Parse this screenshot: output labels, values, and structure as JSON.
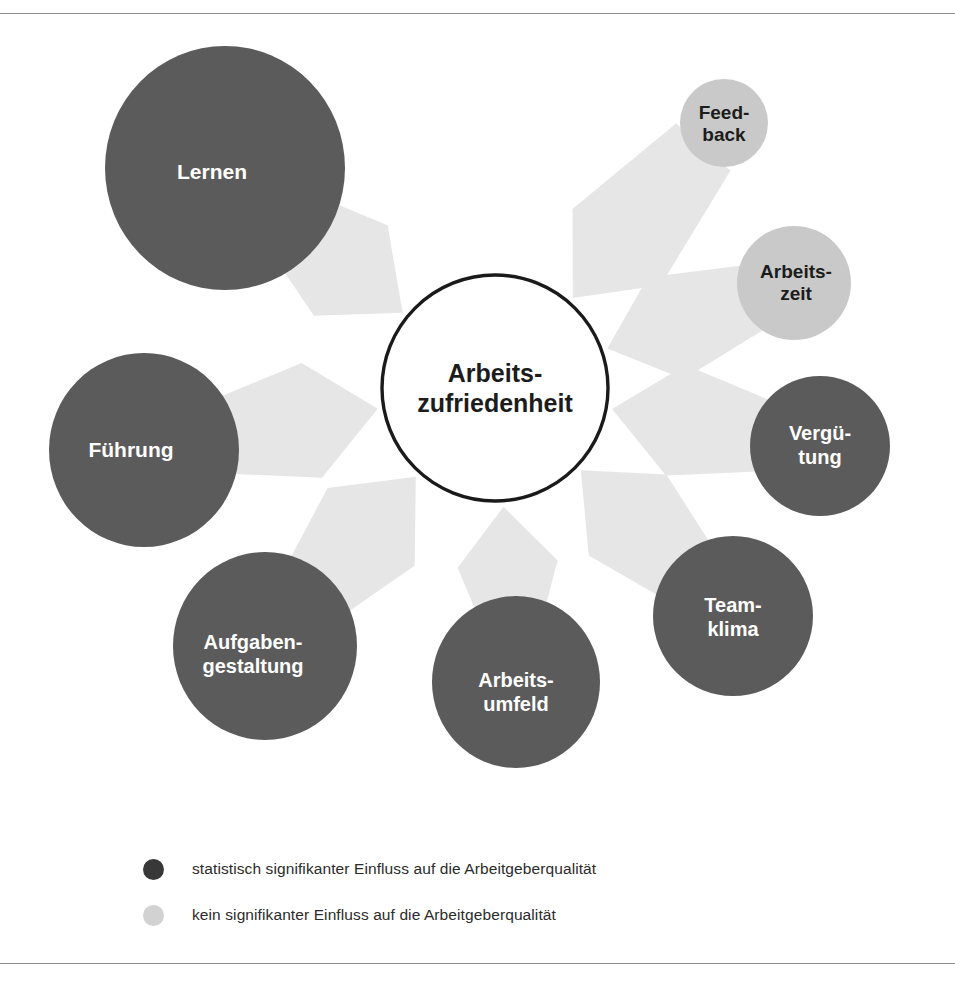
{
  "diagram": {
    "type": "hub-and-spoke",
    "center": {
      "id": "arbeitszufriedenheit",
      "label_line1": "Arbeits-",
      "label_line2": "zufriedenheit",
      "style": "outlined-white",
      "cx": 495,
      "cy": 388,
      "rx": 113,
      "ry": 113
    },
    "colors": {
      "significant_fill": "#5b5b5b",
      "significant_text": "#ffffff",
      "not_significant_fill": "#c9c9c9",
      "not_significant_text": "#1c1c1c",
      "arrow_fill": "#e6e6e6",
      "center_stroke": "#1a1a1a",
      "center_fill": "#ffffff",
      "background": "#ffffff",
      "rule": "#8e8e8e"
    },
    "nodes": [
      {
        "id": "lernen",
        "label_line1": "Lernen",
        "label_line2": "",
        "significant": true,
        "cx": 225,
        "cy": 168,
        "rx": 120,
        "ry": 122,
        "label_cx": 212,
        "label_cy": 172,
        "font_size": 21
      },
      {
        "id": "feedback",
        "label_line1": "Feed-",
        "label_line2": "back",
        "significant": false,
        "cx": 724,
        "cy": 123,
        "rx": 44,
        "ry": 44,
        "label_cx": 724,
        "label_cy": 124,
        "font_size": 19
      },
      {
        "id": "arbeitszeit",
        "label_line1": "Arbeits-",
        "label_line2": "zeit",
        "significant": false,
        "cx": 794,
        "cy": 283,
        "rx": 57,
        "ry": 57,
        "label_cx": 796,
        "label_cy": 283,
        "font_size": 19
      },
      {
        "id": "verguetung",
        "label_line1": "Vergü-",
        "label_line2": "tung",
        "significant": true,
        "cx": 820,
        "cy": 446,
        "rx": 70,
        "ry": 70,
        "label_cx": 820,
        "label_cy": 446,
        "font_size": 20
      },
      {
        "id": "teamklima",
        "label_line1": "Team-",
        "label_line2": "klima",
        "significant": true,
        "cx": 733,
        "cy": 616,
        "rx": 80,
        "ry": 80,
        "label_cx": 733,
        "label_cy": 618,
        "font_size": 20
      },
      {
        "id": "arbeitsumfeld",
        "label_line1": "Arbeits-",
        "label_line2": "umfeld",
        "significant": true,
        "cx": 516,
        "cy": 682,
        "rx": 84,
        "ry": 86,
        "label_cx": 516,
        "label_cy": 693,
        "font_size": 20
      },
      {
        "id": "aufgabengestaltung",
        "label_line1": "Aufgaben-",
        "label_line2": "gestaltung",
        "significant": true,
        "cx": 265,
        "cy": 646,
        "rx": 92,
        "ry": 94,
        "label_cx": 253,
        "label_cy": 655,
        "font_size": 20
      },
      {
        "id": "fuehrung",
        "label_line1": "Führung",
        "label_line2": "",
        "significant": true,
        "cx": 144,
        "cy": 450,
        "rx": 95,
        "ry": 97,
        "label_cx": 131,
        "label_cy": 450,
        "font_size": 21
      }
    ],
    "arrows": [
      {
        "id": "arrow-lernen",
        "from": "lernen",
        "to": "center"
      },
      {
        "id": "arrow-feedback",
        "from": "feedback",
        "to": "center"
      },
      {
        "id": "arrow-arbeitszeit",
        "from": "arbeitszeit",
        "to": "center"
      },
      {
        "id": "arrow-verguetung",
        "from": "verguetung",
        "to": "center"
      },
      {
        "id": "arrow-teamklima",
        "from": "teamklima",
        "to": "center"
      },
      {
        "id": "arrow-arbeitsumfeld",
        "from": "arbeitsumfeld",
        "to": "center"
      },
      {
        "id": "arrow-aufgabengestaltung",
        "from": "aufgabengestaltung",
        "to": "center"
      },
      {
        "id": "arrow-fuehrung",
        "from": "fuehrung",
        "to": "center"
      }
    ]
  },
  "legend": {
    "items": [
      {
        "id": "legend-significant",
        "marker": "significant",
        "text": "statistisch signifikanter Einfluss auf die Arbeitgeberqualität"
      },
      {
        "id": "legend-not-significant",
        "marker": "not-significant",
        "text": "kein signifikanter Einfluss auf die Arbeitgeberqualität"
      }
    ]
  }
}
